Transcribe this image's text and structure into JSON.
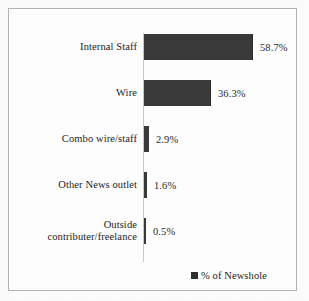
{
  "chart_data": {
    "type": "bar",
    "orientation": "horizontal",
    "title": "",
    "xlabel": "",
    "ylabel": "",
    "grid": false,
    "axis_visible": true,
    "xlim": [
      0,
      58.7
    ],
    "legend_position": "bottom-right",
    "categories": [
      "Internal Staff",
      "Wire",
      "Combo wire/staff",
      "Other News outlet",
      "Outside\ncontributer/freelance"
    ],
    "values": [
      58.7,
      36.3,
      2.9,
      1.6,
      0.5
    ],
    "value_labels": [
      "58.7%",
      "36.3%",
      "2.9%",
      "1.6%",
      "0.5%"
    ],
    "series": [
      {
        "name": "% of Newshole",
        "color": "#3a3a3a",
        "values": [
          58.7,
          36.3,
          2.9,
          1.6,
          0.5
        ]
      }
    ],
    "legend": [
      {
        "label": "% of Newshole",
        "marker": "filled-square",
        "color": "#2e2e2e"
      }
    ]
  },
  "figure": {
    "border_color": "#b4b4b4",
    "axis_color": "#c8c8c8",
    "background": "#ffffff",
    "text_color": "#232323"
  },
  "rows": [
    {
      "label": "Internal Staff",
      "value_label": "58.7%",
      "bar_px": 109,
      "top": 24
    },
    {
      "label": "Wire",
      "value_label": "36.3%",
      "bar_px": 67,
      "top": 70
    },
    {
      "label": "Combo wire/staff",
      "value_label": "2.9%",
      "bar_px": 5,
      "top": 116
    },
    {
      "label": "Other News outlet",
      "value_label": "1.6%",
      "bar_px": 3,
      "top": 162
    },
    {
      "label": "Outside\ncontributer/freelance",
      "value_label": "0.5%",
      "bar_px": 2,
      "top": 208
    }
  ],
  "legend_label": "% of Newshole"
}
